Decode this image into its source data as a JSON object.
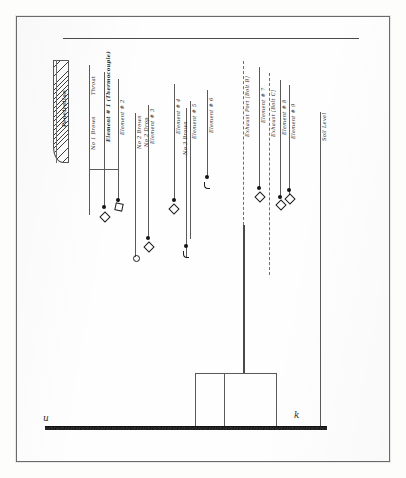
{
  "document": {
    "title": "Hand-drawn instrumentation layout sketch",
    "medium": "scanned pencil drawing on white paper"
  },
  "annotations": {
    "penetration": "Penetration",
    "throat": "Throat",
    "ground_mark_left": "u",
    "ground_mark_right": "k"
  },
  "labels": [
    {
      "id": "penetration",
      "text": "Penetration",
      "style": "bold"
    },
    {
      "id": "throat",
      "text": "Throat",
      "style": "plain"
    },
    {
      "id": "no1-brown",
      "text": "No 1 Brown",
      "style": "plain"
    },
    {
      "id": "element-1",
      "text": "Element # 1 (Thermocouple)",
      "style": "bold"
    },
    {
      "id": "element-2",
      "text": "Element # 2",
      "style": "plain"
    },
    {
      "id": "no2-brown",
      "text": "No 2 Brown",
      "style": "plain"
    },
    {
      "id": "no2-drop",
      "text": "No 2 Drop",
      "style": "plain"
    },
    {
      "id": "element-3",
      "text": "Element # 3",
      "style": "plain"
    },
    {
      "id": "element-4",
      "text": "Element # 4",
      "style": "plain"
    },
    {
      "id": "no3-brown",
      "text": "No 3 Brown",
      "style": "plain"
    },
    {
      "id": "element-5",
      "text": "Element # 5",
      "style": "plain"
    },
    {
      "id": "element-6",
      "text": "Element # 6",
      "style": "plain"
    },
    {
      "id": "exhaust-port-b",
      "text": "Exhaust Port [Bolt B]",
      "style": "plain"
    },
    {
      "id": "element-7",
      "text": "Element # 7",
      "style": "plain"
    },
    {
      "id": "exhaust-bolt-c",
      "text": "Exhaust [Bolt C]",
      "style": "plain"
    },
    {
      "id": "element-8",
      "text": "Element # 8",
      "style": "plain"
    },
    {
      "id": "element-9",
      "text": "Element # 9",
      "style": "plain"
    },
    {
      "id": "soil-level",
      "text": "Soil Level",
      "style": "plain"
    }
  ],
  "colors": {
    "paper": "#fefefe",
    "ink": "#2b2b2b",
    "line": "#5a5a5a",
    "ground": "#1a1a1a",
    "border": "#6a6a6a"
  },
  "counts": {
    "elements": 9,
    "exhaust_ports": 2,
    "lead_lines": 14
  }
}
